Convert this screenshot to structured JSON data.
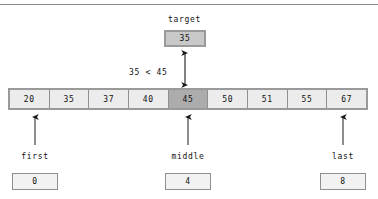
{
  "diagram": {
    "title_label": "target",
    "target_value": "35",
    "comparison_text": "35 < 45",
    "array": {
      "values": [
        "20",
        "35",
        "37",
        "40",
        "45",
        "50",
        "51",
        "55",
        "67"
      ],
      "highlighted_index": 4
    },
    "pointers": [
      {
        "name": "first",
        "label": "first",
        "value": "0"
      },
      {
        "name": "middle",
        "label": "middle",
        "value": "4"
      },
      {
        "name": "last",
        "label": "last",
        "value": "8"
      }
    ],
    "colors": {
      "cell_fill": "#ececec",
      "cell_highlight_fill": "#acacac",
      "target_fill": "#c8c8c8",
      "border": "#9a9a9a",
      "arrow": "#1a1a1a"
    }
  }
}
